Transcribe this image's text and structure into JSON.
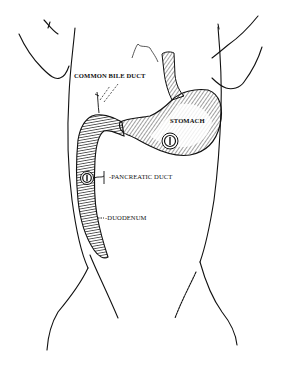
{
  "diagram": {
    "title": "",
    "colors": {
      "background": "#ffffff",
      "ink": "#111111"
    },
    "labels": {
      "common_bile_duct": "COMMON BILE DUCT",
      "stomach": "STOMACH",
      "pancreatic_duct": "-PANCREATIC DUCT",
      "duodenum": "-DUODENUM"
    },
    "nodes": [
      {
        "id": "torso",
        "label": "torso outline"
      },
      {
        "id": "esophagus",
        "label": "esophagus"
      },
      {
        "id": "stomach",
        "label": "STOMACH"
      },
      {
        "id": "duodenum",
        "label": "DUODENUM"
      },
      {
        "id": "common-bile-duct",
        "label": "COMMON BILE DUCT"
      },
      {
        "id": "pancreatic-duct",
        "label": "PANCREATIC DUCT"
      },
      {
        "id": "stomach-tube-section",
        "label": "tube cross-section in stomach"
      },
      {
        "id": "duodenum-tube-section",
        "label": "tube cross-section in duodenum"
      }
    ],
    "edges": [
      {
        "from": "esophagus",
        "to": "stomach"
      },
      {
        "from": "stomach",
        "to": "duodenum"
      },
      {
        "from": "common-bile-duct",
        "to": "duodenum"
      },
      {
        "from": "pancreatic-duct",
        "to": "duodenum"
      }
    ]
  }
}
